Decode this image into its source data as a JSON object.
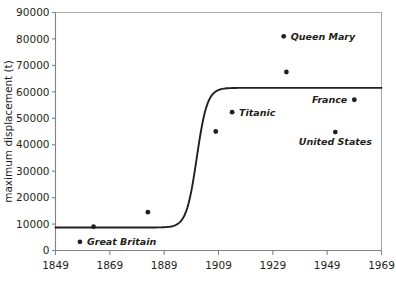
{
  "chart_data": {
    "type": "scatter",
    "title": "",
    "subtitle": "",
    "xlabel": "",
    "ylabel": "maximum displacement (t)",
    "xlim": [
      1849,
      1969
    ],
    "ylim": [
      0,
      90000
    ],
    "grid": false,
    "legend": null,
    "xticks": [
      1849,
      1869,
      1889,
      1909,
      1929,
      1949,
      1969
    ],
    "xtick_labels": [
      "1849",
      "1869",
      "1889",
      "1909",
      "1929",
      "1949",
      "1969"
    ],
    "yticks": [
      0,
      10000,
      20000,
      30000,
      40000,
      50000,
      60000,
      70000,
      80000,
      90000
    ],
    "ytick_labels": [
      "0",
      "10000",
      "20000",
      "30000",
      "40000",
      "50000",
      "60000",
      "70000",
      "80000",
      "90000"
    ],
    "points": [
      {
        "label": "Great Britain",
        "x": 1858,
        "y": 3270,
        "label_position": "right"
      },
      {
        "label": "",
        "x": 1863,
        "y": 9000,
        "label_position": "none"
      },
      {
        "label": "",
        "x": 1883,
        "y": 14500,
        "label_position": "none"
      },
      {
        "label": "",
        "x": 1908,
        "y": 45000,
        "label_position": "none"
      },
      {
        "label": "Titanic",
        "x": 1914,
        "y": 52300,
        "label_position": "right"
      },
      {
        "label": "Queen Mary",
        "x": 1933,
        "y": 81000,
        "label_position": "right"
      },
      {
        "label": "",
        "x": 1934,
        "y": 67500,
        "label_position": "none"
      },
      {
        "label": "United States",
        "x": 1952,
        "y": 44800,
        "label_position": "below"
      },
      {
        "label": "France",
        "x": 1959,
        "y": 57000,
        "label_position": "left"
      }
    ],
    "fit_curve": {
      "type": "logistic",
      "description": "sigmoid fit rising from ~8700 t plateau before 1890 to ~61500 t plateau after 1912",
      "lower_asymptote": 8700,
      "upper_asymptote": 61500,
      "midpoint_year": 1901,
      "growth_rate": 0.52
    }
  },
  "colors": {
    "point": "#231f20",
    "curve": "#231f20",
    "axis": "#808285",
    "frame": "#a7a9ac",
    "text": "#231f20",
    "background": "#ffffff"
  }
}
